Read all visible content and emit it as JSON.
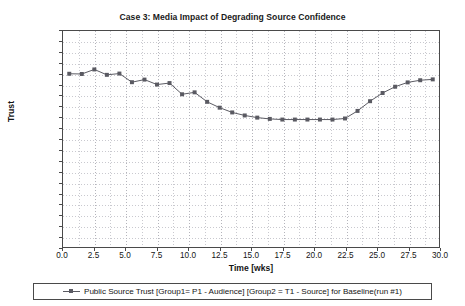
{
  "chart_data": {
    "type": "line",
    "title": "Case 3: Media Impact of Degrading Source Confidence",
    "xlabel": "Time [wks]",
    "ylabel": "Trust",
    "xlim": [
      0.0,
      30.0
    ],
    "ylim": [
      -1.0,
      0.0
    ],
    "grid": true,
    "legend_position": "below-axes",
    "xticks": [
      "0.0",
      "2.5",
      "5.0",
      "7.5",
      "10.0",
      "12.5",
      "15.0",
      "17.5",
      "20.0",
      "22.5",
      "25.0",
      "27.5",
      "30.0"
    ],
    "xtick_values": [
      0.0,
      2.5,
      5.0,
      7.5,
      10.0,
      12.5,
      15.0,
      17.5,
      20.0,
      22.5,
      25.0,
      27.5,
      30.0
    ],
    "yticks": [
      "0.00",
      "-0.05",
      "-0.10",
      "-0.15",
      "-0.20",
      "-0.25",
      "-0.30",
      "-0.35",
      "-0.40",
      "-0.45",
      "-0.50",
      "-0.55",
      "-0.60",
      "-0.65",
      "-0.70",
      "-0.75",
      "-0.80",
      "-0.85",
      "-0.90",
      "-0.95",
      "-1.00"
    ],
    "ytick_values": [
      0.0,
      -0.05,
      -0.1,
      -0.15,
      -0.2,
      -0.25,
      -0.3,
      -0.35,
      -0.4,
      -0.45,
      -0.5,
      -0.55,
      -0.6,
      -0.65,
      -0.7,
      -0.75,
      -0.8,
      -0.85,
      -0.9,
      -0.95,
      -1.0
    ],
    "series": [
      {
        "name": "Public Source Trust [Group1= P1 - Audience] [Group2 = T1 - Source] for Baseline(run #1)",
        "color": "#5a5a62",
        "marker": "square",
        "x": [
          0.5,
          1.5,
          2.5,
          3.5,
          4.5,
          5.5,
          6.5,
          7.5,
          8.5,
          9.5,
          10.5,
          11.5,
          12.5,
          13.5,
          14.5,
          15.5,
          16.5,
          17.5,
          18.5,
          19.5,
          20.5,
          21.5,
          22.5,
          23.5,
          24.5,
          25.5,
          26.5,
          27.5,
          28.5,
          29.5
        ],
        "y": [
          -0.198,
          -0.199,
          -0.178,
          -0.203,
          -0.197,
          -0.237,
          -0.225,
          -0.248,
          -0.241,
          -0.293,
          -0.284,
          -0.328,
          -0.355,
          -0.377,
          -0.391,
          -0.401,
          -0.407,
          -0.41,
          -0.41,
          -0.41,
          -0.41,
          -0.41,
          -0.405,
          -0.37,
          -0.325,
          -0.287,
          -0.258,
          -0.238,
          -0.228,
          -0.224
        ]
      }
    ]
  },
  "legend": {
    "entries": [
      "Public Source Trust [Group1= P1 - Audience] [Group2 = T1 - Source] for Baseline(run #1)"
    ]
  }
}
